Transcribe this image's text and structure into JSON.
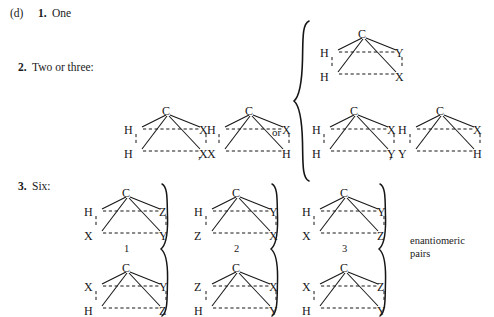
{
  "figure": {
    "part_label": "(d)",
    "enantiomeric_note_line1": "enantiomeric",
    "enantiomeric_note_line2": "pairs",
    "or_label": "or",
    "comma": ","
  },
  "items": [
    {
      "number": "1.",
      "text": "One"
    },
    {
      "number": "2.",
      "text": "Two or three:"
    },
    {
      "number": "3.",
      "text": "Six:"
    }
  ],
  "molecules": {
    "two_or_three_left": [
      {
        "id": "m2a",
        "apex": "C",
        "middle_left": "H",
        "middle_right": "X",
        "bottom_left": "H",
        "bottom_right": "X",
        "number": ""
      },
      {
        "id": "m2b",
        "apex": "C",
        "middle_left": "H",
        "middle_right": "X",
        "bottom_left": "X",
        "bottom_right": "H",
        "number": ""
      }
    ],
    "brace_top": [
      {
        "id": "m3a",
        "apex": "C",
        "middle_left": "H",
        "middle_right": "Y",
        "bottom_left": "H",
        "bottom_right": "X",
        "number": ""
      }
    ],
    "brace_bottom": [
      {
        "id": "m3b",
        "apex": "C",
        "middle_left": "H",
        "middle_right": "X",
        "bottom_left": "H",
        "bottom_right": "Y",
        "number": ""
      },
      {
        "id": "m3c",
        "apex": "C",
        "middle_left": "H",
        "middle_right": "X",
        "bottom_left": "Y",
        "bottom_right": "H",
        "number": ""
      }
    ],
    "six_top_row": [
      {
        "id": "m6-1",
        "apex": "C",
        "middle_left": "H",
        "middle_right": "Z",
        "bottom_left": "X",
        "bottom_right": "Y",
        "number": "1"
      },
      {
        "id": "m6-2",
        "apex": "C",
        "middle_left": "H",
        "middle_right": "Y",
        "bottom_left": "Z",
        "bottom_right": "X",
        "number": "2"
      },
      {
        "id": "m6-3",
        "apex": "C",
        "middle_left": "H",
        "middle_right": "Y",
        "bottom_left": "X",
        "bottom_right": "Z",
        "number": "3"
      }
    ],
    "six_bottom_row": [
      {
        "id": "m6-4",
        "apex": "C",
        "middle_left": "X",
        "middle_right": "Y",
        "bottom_left": "H",
        "bottom_right": "Z",
        "number": ""
      },
      {
        "id": "m6-5",
        "apex": "C",
        "middle_left": "Z",
        "middle_right": "X",
        "bottom_left": "H",
        "bottom_right": "Y",
        "number": ""
      },
      {
        "id": "m6-6",
        "apex": "C",
        "middle_left": "X",
        "middle_right": "Z",
        "bottom_left": "H",
        "bottom_right": "Y",
        "number": ""
      }
    ]
  },
  "colors": {
    "ink": "#1a1a1a",
    "background": "#ffffff"
  }
}
